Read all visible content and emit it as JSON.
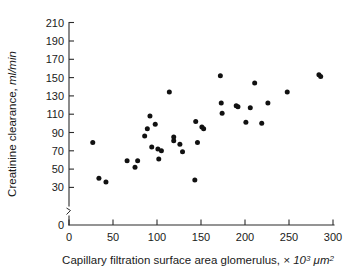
{
  "chart_data": {
    "type": "scatter",
    "title": "",
    "xlabel": "Capillary filtration surface area glomerulus, × 10³ μm²",
    "ylabel": "Creatinine clearance, ml/min",
    "xlim": [
      0,
      300
    ],
    "ylim": [
      0,
      210
    ],
    "xticks": [
      0,
      50,
      100,
      150,
      200,
      250,
      300
    ],
    "yticks": [
      0,
      30,
      50,
      70,
      90,
      110,
      130,
      150,
      170,
      190,
      210
    ],
    "grid": false,
    "legend": null,
    "y_axis_break": true,
    "y_axis_break_between": [
      0,
      30
    ],
    "marker": "filled-circle",
    "marker_color": "#111111",
    "points": [
      {
        "x": 27,
        "y": 79
      },
      {
        "x": 34,
        "y": 40
      },
      {
        "x": 42,
        "y": 36
      },
      {
        "x": 66,
        "y": 59
      },
      {
        "x": 75,
        "y": 52
      },
      {
        "x": 78,
        "y": 59
      },
      {
        "x": 86,
        "y": 86
      },
      {
        "x": 89,
        "y": 94
      },
      {
        "x": 92,
        "y": 108
      },
      {
        "x": 94,
        "y": 74
      },
      {
        "x": 98,
        "y": 99
      },
      {
        "x": 101,
        "y": 72
      },
      {
        "x": 102,
        "y": 61
      },
      {
        "x": 105,
        "y": 70
      },
      {
        "x": 114,
        "y": 134
      },
      {
        "x": 119,
        "y": 85
      },
      {
        "x": 119,
        "y": 81
      },
      {
        "x": 126,
        "y": 77
      },
      {
        "x": 129,
        "y": 69
      },
      {
        "x": 143,
        "y": 38
      },
      {
        "x": 144,
        "y": 102
      },
      {
        "x": 146,
        "y": 79
      },
      {
        "x": 151,
        "y": 96
      },
      {
        "x": 153,
        "y": 94
      },
      {
        "x": 172,
        "y": 152
      },
      {
        "x": 173,
        "y": 122
      },
      {
        "x": 174,
        "y": 111
      },
      {
        "x": 190,
        "y": 119
      },
      {
        "x": 192,
        "y": 118
      },
      {
        "x": 201,
        "y": 101
      },
      {
        "x": 206,
        "y": 117
      },
      {
        "x": 211,
        "y": 144
      },
      {
        "x": 219,
        "y": 100
      },
      {
        "x": 226,
        "y": 122
      },
      {
        "x": 248,
        "y": 134
      },
      {
        "x": 284,
        "y": 153
      },
      {
        "x": 286,
        "y": 151
      }
    ]
  },
  "axes": {
    "y_tick_labels": [
      "210",
      "190",
      "170",
      "150",
      "130",
      "110",
      "90",
      "70",
      "50",
      "30",
      "0"
    ],
    "x_tick_labels": [
      "0",
      "50",
      "100",
      "150",
      "200",
      "250",
      "300"
    ],
    "y_title_main": "Creatinine clearance, ",
    "y_title_unit": "ml/min",
    "x_title_main": "Capillary filtration surface area glomerulus, ",
    "x_title_unit": "× 10",
    "x_title_sup1": "3",
    "x_title_unit2": " μm",
    "x_title_sup2": "2"
  }
}
